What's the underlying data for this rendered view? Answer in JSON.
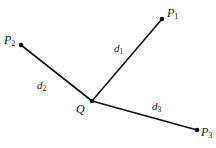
{
  "diagram": {
    "colors": {
      "line": "#111111",
      "background": "#ffffff"
    },
    "center": {
      "label": "Q",
      "x": 92,
      "y": 101
    },
    "points": [
      {
        "id": "P1",
        "label": "P",
        "sub": "1",
        "x": 162,
        "y": 19,
        "lx": 167,
        "ly": 17
      },
      {
        "id": "P2",
        "label": "P",
        "sub": "2",
        "x": 21,
        "y": 45,
        "lx": 4,
        "ly": 44
      },
      {
        "id": "P3",
        "label": "P",
        "sub": "3",
        "x": 197,
        "y": 130,
        "lx": 201,
        "ly": 136
      }
    ],
    "distances": [
      {
        "label": "d",
        "sub": "1",
        "x": 114,
        "y": 52
      },
      {
        "label": "d",
        "sub": "2",
        "x": 37,
        "y": 89
      },
      {
        "label": "d",
        "sub": "3",
        "x": 152,
        "y": 110
      }
    ],
    "center_label_pos": {
      "x": 76,
      "y": 113
    }
  }
}
